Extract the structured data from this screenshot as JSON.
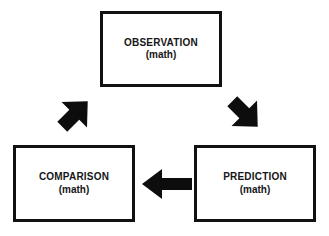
{
  "diagram": {
    "type": "cycle-flowchart",
    "background_color": "#ffffff",
    "stroke_color": "#111111",
    "text_color": "#161616",
    "nodes": [
      {
        "id": "observation",
        "title": "OBSERVATION",
        "subtitle": "(math)",
        "position": "top-center"
      },
      {
        "id": "comparison",
        "title": "COMPARISON",
        "subtitle": "(math)",
        "position": "bottom-left"
      },
      {
        "id": "prediction",
        "title": "PREDICTION",
        "subtitle": "(math)",
        "position": "bottom-right"
      }
    ],
    "arrows": [
      {
        "id": "comparison-to-observation",
        "from": "comparison",
        "to": "observation",
        "direction": "up-right",
        "style": "solid-block-arrow"
      },
      {
        "id": "observation-to-prediction",
        "from": "observation",
        "to": "prediction",
        "direction": "down-right",
        "style": "solid-block-arrow"
      },
      {
        "id": "prediction-to-comparison",
        "from": "prediction",
        "to": "comparison",
        "direction": "left",
        "style": "solid-block-arrow"
      }
    ]
  }
}
